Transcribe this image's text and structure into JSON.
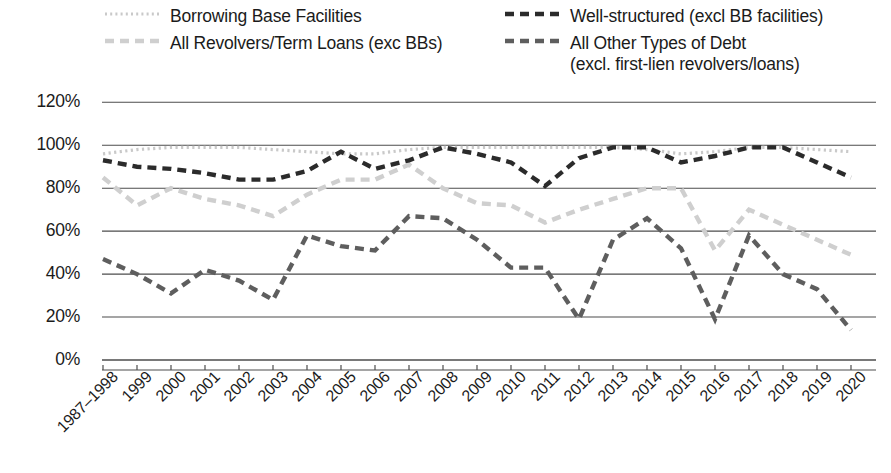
{
  "chart_data": {
    "type": "line",
    "title": "",
    "xlabel": "",
    "ylabel": "",
    "ylim": [
      0,
      120
    ],
    "ytick_step": 20,
    "ytick_labels": [
      "0%",
      "20%",
      "40%",
      "60%",
      "80%",
      "100%",
      "120%"
    ],
    "grid": true,
    "legend_position": "top",
    "categories": [
      "1987–1998",
      "1999",
      "2000",
      "2001",
      "2002",
      "2003",
      "2004",
      "2005",
      "2006",
      "2007",
      "2008",
      "2009",
      "2010",
      "2011",
      "2012",
      "2013",
      "2014",
      "2015",
      "2016",
      "2017",
      "2018",
      "2019",
      "2020"
    ],
    "series": [
      {
        "name": "Borrowing Base Facilities",
        "style": "dotted",
        "color": "#c9c9c9",
        "values": [
          96,
          98,
          99,
          99,
          99,
          98,
          97,
          96,
          96,
          98,
          99,
          99,
          99,
          99,
          99,
          99,
          98,
          96,
          97,
          99,
          99,
          98,
          97
        ]
      },
      {
        "name": "Well-structured (excl BB facilities)",
        "style": "dashed",
        "color": "#2b2b2b",
        "values": [
          93,
          90,
          89,
          87,
          84,
          84,
          88,
          97,
          89,
          93,
          99,
          96,
          92,
          81,
          94,
          99,
          99,
          92,
          95,
          99,
          99,
          92,
          85
        ]
      },
      {
        "name": "All Revolvers/Term Loans (exc BBs)",
        "style": "dashed",
        "color": "#cfcfcf",
        "values": [
          85,
          72,
          80,
          75,
          72,
          67,
          77,
          84,
          84,
          91,
          80,
          73,
          72,
          64,
          70,
          75,
          80,
          80,
          51,
          70,
          63,
          56,
          49
        ]
      },
      {
        "name": "All Other Types of Debt\n(excl. first-lien revolvers/loans)",
        "style": "dashed",
        "color": "#5e5e5e",
        "values": [
          47,
          40,
          31,
          42,
          37,
          28,
          58,
          53,
          51,
          67,
          66,
          56,
          43,
          43,
          19,
          56,
          66,
          52,
          19,
          58,
          40,
          33,
          14
        ]
      }
    ]
  },
  "legend": {
    "items": [
      {
        "label": "Borrowing Base Facilities",
        "style": "dotted",
        "color": "#c9c9c9"
      },
      {
        "label": "Well-structured (excl BB facilities)",
        "style": "dashed",
        "color": "#2b2b2b"
      },
      {
        "label": "All Revolvers/Term Loans (exc BBs)",
        "style": "dashed",
        "color": "#cfcfcf"
      },
      {
        "label": "All Other Types of Debt\n(excl. first-lien revolvers/loans)",
        "style": "dashed",
        "color": "#5e5e5e"
      }
    ]
  },
  "axis": {
    "gridline_color": "#4d4d4d",
    "text_color": "#1b1b1b"
  }
}
